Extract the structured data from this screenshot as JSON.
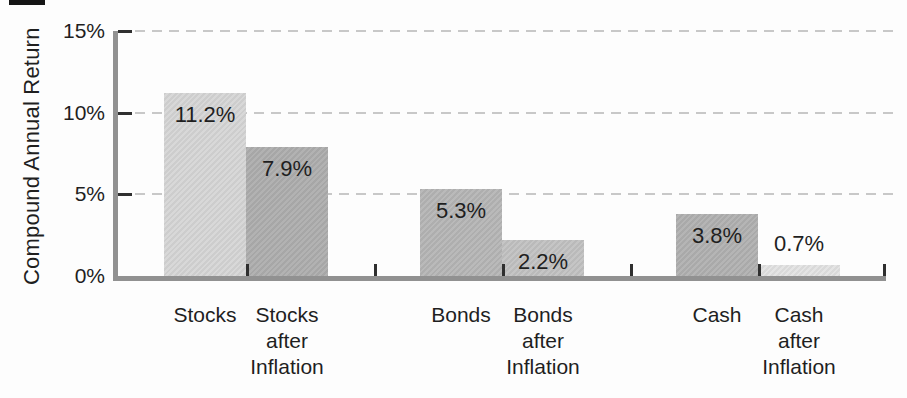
{
  "chart_data": {
    "type": "bar",
    "title": "",
    "xlabel": "",
    "ylabel": "Compound Annual Return",
    "ylim": [
      0,
      15
    ],
    "grid": "horizontal-dashed",
    "legend": "none",
    "yticks": [
      {
        "value": 0,
        "label": "0%"
      },
      {
        "value": 5,
        "label": "5%"
      },
      {
        "value": 10,
        "label": "10%"
      },
      {
        "value": 15,
        "label": "15%"
      }
    ],
    "bars": [
      {
        "category": "Stocks",
        "category_lines": [
          "Stocks"
        ],
        "value": 11.2,
        "label": "11.2%",
        "color": "#d6d6d6",
        "label_position": "inside"
      },
      {
        "category": "Stocks after Inflation",
        "category_lines": [
          "Stocks",
          "after",
          "Inflation"
        ],
        "value": 7.9,
        "label": "7.9%",
        "color": "#aeaeae",
        "label_position": "inside"
      },
      {
        "category": "Bonds",
        "category_lines": [
          "Bonds"
        ],
        "value": 5.3,
        "label": "5.3%",
        "color": "#b6b6b6",
        "label_position": "inside"
      },
      {
        "category": "Bonds after Inflation",
        "category_lines": [
          "Bonds",
          "after",
          "Inflation"
        ],
        "value": 2.2,
        "label": "2.2%",
        "color": "#c2c2c2",
        "label_position": "inside"
      },
      {
        "category": "Cash",
        "category_lines": [
          "Cash"
        ],
        "value": 3.8,
        "label": "3.8%",
        "color": "#b1b1b1",
        "label_position": "inside"
      },
      {
        "category": "Cash after Inflation",
        "category_lines": [
          "Cash",
          "after",
          "Inflation"
        ],
        "value": 0.7,
        "label": "0.7%",
        "color": "#e3e3e3",
        "label_position": "above"
      }
    ]
  },
  "colors": {
    "background": "#fdfdfd",
    "axis": "#919191",
    "grid": "#c8c8c8",
    "tick": "#2f2f2f",
    "text": "#1f1f1f"
  }
}
